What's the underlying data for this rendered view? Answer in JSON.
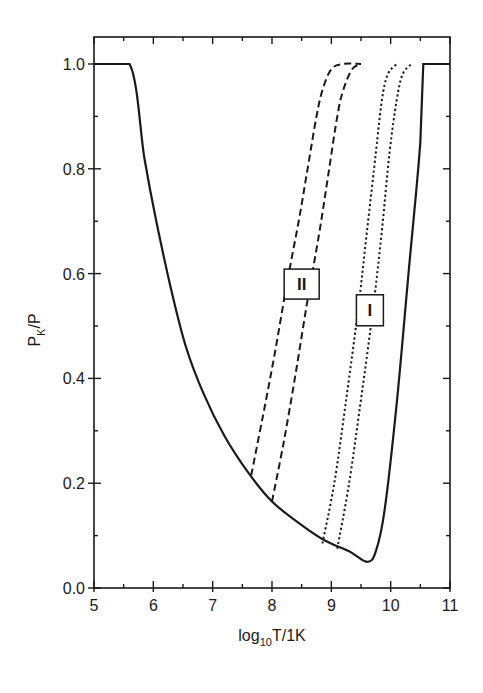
{
  "chart_data": {
    "type": "line",
    "title": "",
    "xlabel": "log10T/1K",
    "xlabel_main": "log",
    "xlabel_sub": "10",
    "xlabel_rest": "T/1K",
    "ylabel": "PK/P",
    "ylabel_main": "P",
    "ylabel_sub": "K",
    "ylabel_rest": "/P",
    "xlim": [
      5,
      11
    ],
    "ylim": [
      0,
      1.05
    ],
    "x_ticks": [
      "5",
      "6",
      "7",
      "8",
      "9",
      "10",
      "11"
    ],
    "y_ticks": [
      "0.0",
      "0.2",
      "0.4",
      "0.6",
      "0.8",
      "1.0"
    ],
    "grid": false,
    "legend": "none",
    "annotations": [
      {
        "text": "II",
        "x": 8.5,
        "y": 0.58,
        "refers_to": "dashed curves"
      },
      {
        "text": "I",
        "x": 9.65,
        "y": 0.53,
        "refers_to": "dotted curves"
      }
    ],
    "series": [
      {
        "name": "solid boundary",
        "style": "solid",
        "x": [
          5.0,
          5.6,
          5.85,
          6.05,
          6.3,
          6.55,
          6.85,
          7.2,
          7.6,
          8.0,
          8.5,
          8.9,
          9.3,
          9.6,
          9.75,
          9.9,
          10.1,
          10.3,
          10.5,
          10.55,
          11.0
        ],
        "y": [
          1.0,
          1.0,
          0.82,
          0.7,
          0.57,
          0.46,
          0.37,
          0.29,
          0.22,
          0.165,
          0.12,
          0.09,
          0.07,
          0.05,
          0.07,
          0.15,
          0.35,
          0.6,
          0.85,
          1.0,
          1.0
        ]
      },
      {
        "name": "II-a",
        "style": "dashed",
        "x": [
          7.65,
          7.85,
          8.05,
          8.25,
          8.45,
          8.6,
          8.75,
          8.85,
          9.0,
          9.2,
          9.5
        ],
        "y": [
          0.215,
          0.33,
          0.45,
          0.58,
          0.7,
          0.8,
          0.9,
          0.95,
          0.99,
          1.0,
          1.0
        ]
      },
      {
        "name": "II-b",
        "style": "dashed",
        "x": [
          8.0,
          8.2,
          8.4,
          8.6,
          8.8,
          8.95,
          9.1,
          9.2,
          9.35,
          9.5
        ],
        "y": [
          0.165,
          0.28,
          0.41,
          0.55,
          0.68,
          0.79,
          0.9,
          0.95,
          0.99,
          1.0
        ]
      },
      {
        "name": "I-a",
        "style": "dotted",
        "x": [
          8.85,
          9.05,
          9.25,
          9.45,
          9.6,
          9.75,
          9.85,
          9.95,
          10.1
        ],
        "y": [
          0.085,
          0.2,
          0.36,
          0.53,
          0.68,
          0.83,
          0.93,
          0.98,
          1.0
        ]
      },
      {
        "name": "I-b",
        "style": "dotted",
        "x": [
          9.1,
          9.3,
          9.5,
          9.7,
          9.85,
          9.98,
          10.1,
          10.2,
          10.35
        ],
        "y": [
          0.075,
          0.2,
          0.36,
          0.53,
          0.68,
          0.83,
          0.93,
          0.98,
          1.0
        ]
      }
    ]
  }
}
